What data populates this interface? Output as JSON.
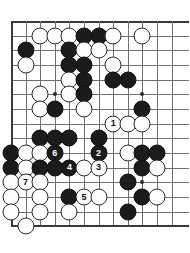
{
  "board": {
    "kind": "go-board-diagram",
    "cols": 12,
    "rows": 14,
    "origin_x": 11,
    "origin_y": 21,
    "step_x": 14.6,
    "step_y": 14.67,
    "line_color": "#6f6f6f",
    "edge_color": "#3a3a3a",
    "black_color": "#1b1b1b",
    "white_color": "#fdfdfd",
    "background": "#ffffff",
    "star_points": [
      {
        "col": 4,
        "row": 6
      },
      {
        "col": 10,
        "row": 6
      },
      {
        "col": 10,
        "row": 12
      }
    ],
    "edges": {
      "top": true,
      "left": true,
      "bottom": true,
      "right": false
    },
    "stones": [
      {
        "col": 3,
        "row": 2,
        "color": "white",
        "label": ""
      },
      {
        "col": 4,
        "row": 2,
        "color": "white",
        "label": ""
      },
      {
        "col": 5,
        "row": 2,
        "color": "white",
        "label": ""
      },
      {
        "col": 6,
        "row": 2,
        "color": "black",
        "label": ""
      },
      {
        "col": 7,
        "row": 2,
        "color": "black",
        "label": ""
      },
      {
        "col": 8,
        "row": 2,
        "color": "white",
        "label": ""
      },
      {
        "col": 10,
        "row": 2,
        "color": "white",
        "label": ""
      },
      {
        "col": 2,
        "row": 3,
        "color": "black",
        "label": ""
      },
      {
        "col": 5,
        "row": 3,
        "color": "black",
        "label": ""
      },
      {
        "col": 6,
        "row": 3,
        "color": "white",
        "label": ""
      },
      {
        "col": 7,
        "row": 3,
        "color": "white",
        "label": ""
      },
      {
        "col": 2,
        "row": 4,
        "color": "white",
        "label": ""
      },
      {
        "col": 5,
        "row": 4,
        "color": "black",
        "label": ""
      },
      {
        "col": 6,
        "row": 4,
        "color": "black",
        "label": ""
      },
      {
        "col": 8,
        "row": 4,
        "color": "white",
        "label": ""
      },
      {
        "col": 5,
        "row": 5,
        "color": "white",
        "label": ""
      },
      {
        "col": 6,
        "row": 5,
        "color": "black",
        "label": ""
      },
      {
        "col": 8,
        "row": 5,
        "color": "black",
        "label": ""
      },
      {
        "col": 9,
        "row": 5,
        "color": "black",
        "label": ""
      },
      {
        "col": 3,
        "row": 6,
        "color": "white",
        "label": ""
      },
      {
        "col": 5,
        "row": 6,
        "color": "white",
        "label": ""
      },
      {
        "col": 6,
        "row": 6,
        "color": "black",
        "label": ""
      },
      {
        "col": 3,
        "row": 7,
        "color": "white",
        "label": ""
      },
      {
        "col": 4,
        "row": 7,
        "color": "black",
        "label": ""
      },
      {
        "col": 6,
        "row": 7,
        "color": "white",
        "label": ""
      },
      {
        "col": 10,
        "row": 7,
        "color": "black",
        "label": ""
      },
      {
        "col": 8,
        "row": 8,
        "color": "white",
        "label": "1"
      },
      {
        "col": 9,
        "row": 8,
        "color": "white",
        "label": ""
      },
      {
        "col": 10,
        "row": 8,
        "color": "white",
        "label": ""
      },
      {
        "col": 3,
        "row": 9,
        "color": "black",
        "label": ""
      },
      {
        "col": 4,
        "row": 9,
        "color": "black",
        "label": ""
      },
      {
        "col": 5,
        "row": 9,
        "color": "black",
        "label": ""
      },
      {
        "col": 7,
        "row": 9,
        "color": "black",
        "label": ""
      },
      {
        "col": 1,
        "row": 10,
        "color": "black",
        "label": ""
      },
      {
        "col": 2,
        "row": 10,
        "color": "white",
        "label": ""
      },
      {
        "col": 3,
        "row": 10,
        "color": "white",
        "label": ""
      },
      {
        "col": 4,
        "row": 10,
        "color": "black",
        "label": "6"
      },
      {
        "col": 7,
        "row": 10,
        "color": "black",
        "label": "2"
      },
      {
        "col": 9,
        "row": 10,
        "color": "white",
        "label": ""
      },
      {
        "col": 10,
        "row": 10,
        "color": "black",
        "label": ""
      },
      {
        "col": 11,
        "row": 10,
        "color": "black",
        "label": ""
      },
      {
        "col": 1,
        "row": 11,
        "color": "black",
        "label": ""
      },
      {
        "col": 2,
        "row": 11,
        "color": "white",
        "label": ""
      },
      {
        "col": 3,
        "row": 11,
        "color": "black",
        "label": ""
      },
      {
        "col": 4,
        "row": 11,
        "color": "black",
        "label": ""
      },
      {
        "col": 5,
        "row": 11,
        "color": "black",
        "label": "4"
      },
      {
        "col": 6,
        "row": 11,
        "color": "white",
        "label": ""
      },
      {
        "col": 7,
        "row": 11,
        "color": "white",
        "label": "3"
      },
      {
        "col": 10,
        "row": 11,
        "color": "black",
        "label": ""
      },
      {
        "col": 11,
        "row": 11,
        "color": "white",
        "label": ""
      },
      {
        "col": 1,
        "row": 12,
        "color": "white",
        "label": ""
      },
      {
        "col": 2,
        "row": 12,
        "color": "white",
        "label": "7"
      },
      {
        "col": 3,
        "row": 12,
        "color": "white",
        "label": ""
      },
      {
        "col": 9,
        "row": 12,
        "color": "black",
        "label": ""
      },
      {
        "col": 1,
        "row": 13,
        "color": "white",
        "label": ""
      },
      {
        "col": 3,
        "row": 13,
        "color": "white",
        "label": ""
      },
      {
        "col": 5,
        "row": 13,
        "color": "black",
        "label": ""
      },
      {
        "col": 6,
        "row": 13,
        "color": "white",
        "label": "5"
      },
      {
        "col": 7,
        "row": 13,
        "color": "white",
        "label": ""
      },
      {
        "col": 10,
        "row": 13,
        "color": "black",
        "label": ""
      },
      {
        "col": 11,
        "row": 13,
        "color": "white",
        "label": ""
      },
      {
        "col": 1,
        "row": 14,
        "color": "white",
        "label": ""
      },
      {
        "col": 3,
        "row": 14,
        "color": "white",
        "label": ""
      },
      {
        "col": 5,
        "row": 14,
        "color": "white",
        "label": ""
      },
      {
        "col": 9,
        "row": 14,
        "color": "black",
        "label": ""
      },
      {
        "col": 2,
        "row": 15,
        "color": "white",
        "label": ""
      }
    ],
    "move_numbers": [
      "1",
      "2",
      "3",
      "4",
      "5",
      "6",
      "7"
    ]
  }
}
